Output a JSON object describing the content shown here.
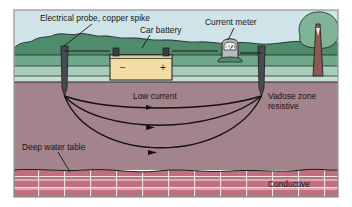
{
  "figure": {
    "labels": {
      "probe": "Electrical probe, copper spike",
      "battery": "Car battery",
      "meter": "Current meter",
      "low_current": "Low current",
      "vadose_line1": "Vadose zone",
      "vadose_line2": "resistive",
      "water_table": "Deep water table",
      "conductive": "Conductive"
    },
    "battery_terminals": {
      "negative": "–",
      "positive": "+"
    },
    "colors": {
      "sky": "#cfe4e8",
      "hill_dark": "#4f8c6e",
      "hill_mid": "#6fa98a",
      "ground_band": "#a9cdbb",
      "grass_light": "#c4ddd0",
      "subsurface": "#a3848d",
      "brick_fill": "#bf6f7e",
      "brick_dark": "#a85c6b",
      "battery_body": "#f2dca6",
      "probe_gray": "#4a4a52",
      "meter_gray": "#b9babe",
      "tree_trunk": "#8c5a52",
      "tree_canopy": "#7fb496",
      "outline": "#1a1a1a",
      "border": "#9aa3a6"
    },
    "annotations": {
      "arc_count": 3,
      "arc_description": "Three curved current-flow arcs from left probe tip to right probe tip, each with a mid-line arrowhead"
    }
  }
}
